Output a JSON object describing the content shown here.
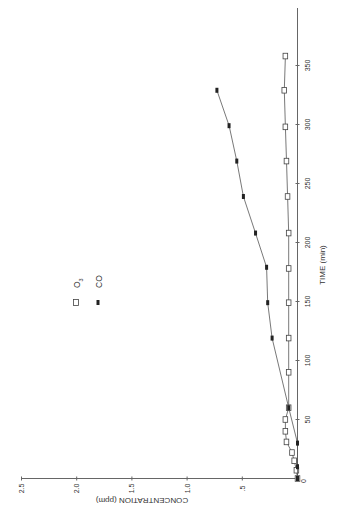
{
  "chart_data": {
    "type": "line",
    "orientation_note": "figure printed rotated 90 degrees counter-clockwise",
    "title": "",
    "xlabel": "TIME (min)",
    "ylabel": "CONCENTRATION (ppm)",
    "xlim": [
      0,
      400
    ],
    "ylim": [
      0,
      2.5
    ],
    "xticks": [
      0,
      50,
      100,
      150,
      200,
      250,
      300,
      350
    ],
    "xtick_labels": [
      "0",
      "50",
      "100",
      "150",
      "200",
      "250",
      "300",
      "350"
    ],
    "yticks": [
      0,
      0.5,
      1.0,
      1.5,
      2.0,
      2.5
    ],
    "ytick_labels": [
      "0",
      ".5",
      "1.0",
      "1.5",
      "2.0",
      "2.5"
    ],
    "grid": false,
    "legend_position": "upper-left",
    "series": [
      {
        "name": "O3",
        "label_main": "O",
        "label_sub": "3",
        "marker": "open-square",
        "x": [
          0,
          7,
          15,
          22,
          31,
          40,
          50,
          60,
          90,
          119,
          149,
          178,
          208,
          239,
          269,
          298,
          329,
          358
        ],
        "y": [
          0.0,
          0.01,
          0.03,
          0.05,
          0.1,
          0.11,
          0.11,
          0.08,
          0.08,
          0.08,
          0.08,
          0.08,
          0.08,
          0.09,
          0.1,
          0.11,
          0.12,
          0.11
        ]
      },
      {
        "name": "CO",
        "label_main": "CO",
        "label_sub": "",
        "marker": "filled-star",
        "x": [
          0,
          10,
          30,
          60,
          119,
          149,
          179,
          208,
          239,
          269,
          299,
          329
        ],
        "y": [
          0.0,
          0.0,
          0.0,
          0.08,
          0.23,
          0.27,
          0.28,
          0.38,
          0.49,
          0.55,
          0.62,
          0.73
        ]
      }
    ]
  },
  "colors": {
    "axis": "#555555",
    "line": "#444444",
    "marker": "#222222",
    "text": "#333333"
  }
}
